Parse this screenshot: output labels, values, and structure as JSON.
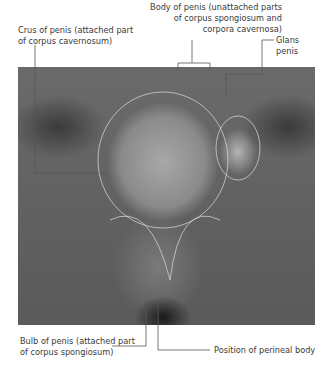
{
  "labels": {
    "crus": [
      "Crus of penis (attached part",
      "of corpus cavernosum)"
    ],
    "body": [
      "Body of penis (unattached parts",
      "of corpus spongiosum and",
      "corpora cavernosa)"
    ],
    "glans": "Glans penis",
    "bulb": [
      "Bulb of penis (attached part",
      "of corpus spongiosum)"
    ],
    "perineal": "Position of perineal body"
  }
}
